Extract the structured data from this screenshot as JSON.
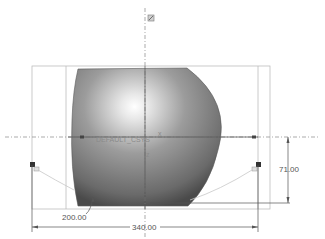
{
  "view": {
    "type": "CAD sketch / 3D model view",
    "csys_label": "DEFAULT_CSYS",
    "axis_labels": {
      "x": "x",
      "z": "z"
    },
    "colors": {
      "background": "#ffffff",
      "surface_light": "#f2f2f2",
      "surface_mid": "#9a9a9a",
      "surface_dark": "#4a4a4a",
      "dimension_line": "#555555",
      "centerline": "#888888"
    }
  },
  "dimensions": {
    "radius": "200.00",
    "width": "340.00",
    "height": "71.00"
  }
}
